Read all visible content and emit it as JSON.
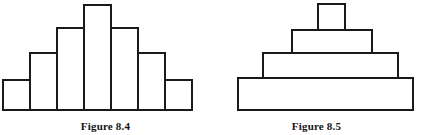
{
  "page": {
    "background_color": "#ffffff",
    "ink_color": "#1a1a1a",
    "width": 422,
    "height": 135
  },
  "figures": [
    {
      "id": "figure-8-4",
      "caption": "Figure 8.4",
      "kind": "histogram",
      "description": "symmetric stepped bar chart",
      "baseline_y": 110,
      "bar_count": 7,
      "bars": [
        {
          "index": 1,
          "x": 3,
          "width": 27,
          "top": 80,
          "height": 30
        },
        {
          "index": 2,
          "x": 30,
          "width": 27,
          "top": 53,
          "height": 57
        },
        {
          "index": 3,
          "x": 57,
          "width": 27,
          "top": 28,
          "height": 82
        },
        {
          "index": 4,
          "x": 84,
          "width": 27,
          "top": 5,
          "height": 105
        },
        {
          "index": 5,
          "x": 111,
          "width": 27,
          "top": 28,
          "height": 82
        },
        {
          "index": 6,
          "x": 138,
          "width": 27,
          "top": 53,
          "height": 57
        },
        {
          "index": 7,
          "x": 165,
          "width": 27,
          "top": 80,
          "height": 30
        }
      ]
    },
    {
      "id": "figure-8-5",
      "caption": "Figure 8.5",
      "kind": "stacked-pyramid",
      "description": "four centered stacked rectangles forming a stepped pyramid",
      "baseline_y": 110,
      "tier_count": 4,
      "tiers": [
        {
          "index": 1,
          "position": "top",
          "x": 107,
          "width": 27,
          "top": 4,
          "height": 26
        },
        {
          "index": 2,
          "position": "upper",
          "x": 81,
          "width": 80,
          "top": 30,
          "height": 23
        },
        {
          "index": 3,
          "position": "lower",
          "x": 52,
          "width": 135,
          "top": 53,
          "height": 25
        },
        {
          "index": 4,
          "position": "bottom",
          "x": 27,
          "width": 175,
          "top": 78,
          "height": 32
        }
      ]
    }
  ],
  "chart_data": [
    {
      "type": "bar",
      "title": "Figure 8.4",
      "categories": [
        "1",
        "2",
        "3",
        "4",
        "5",
        "6",
        "7"
      ],
      "values": [
        30,
        57,
        82,
        105,
        82,
        57,
        30
      ],
      "xlabel": "",
      "ylabel": "",
      "ylim": [
        0,
        110
      ],
      "grid": false,
      "legend": "none",
      "notes": "Symmetric unimodal distribution; bars drawn as open outlines with no fill."
    },
    {
      "type": "bar",
      "title": "Figure 8.5",
      "categories": [
        "bottom",
        "lower",
        "upper",
        "top"
      ],
      "values": [
        175,
        135,
        80,
        27
      ],
      "value_meaning": "tier width in pixels",
      "xlabel": "",
      "ylabel": "",
      "grid": false,
      "legend": "none",
      "notes": "Four centered stacked rectangles of decreasing width forming a stepped pyramid; outlines only, no fill."
    }
  ]
}
